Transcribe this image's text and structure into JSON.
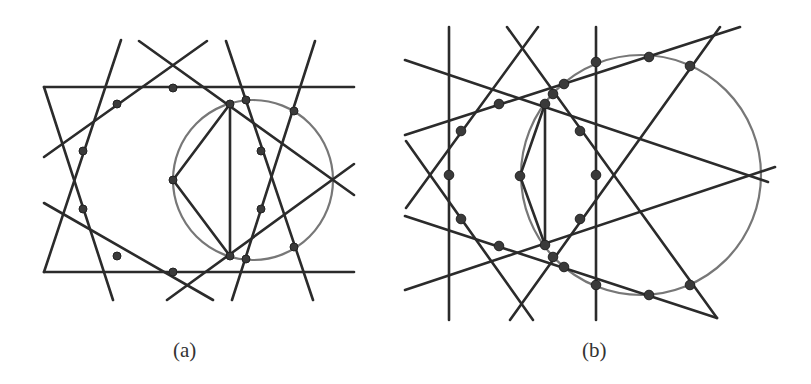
{
  "figure": {
    "panels": [
      {
        "id": "a",
        "caption": "(a)",
        "circle": {
          "cx": 253,
          "cy": 180,
          "r": 80,
          "stroke": "#777777"
        },
        "lines": [
          [
            44,
            87,
            354,
            87
          ],
          [
            44,
            272,
            354,
            272
          ],
          [
            44,
            87,
            113,
            300
          ],
          [
            44,
            272,
            121,
            40
          ],
          [
            44,
            157,
            207,
            41
          ],
          [
            44,
            203,
            213,
            300
          ],
          [
            139,
            41,
            354,
            195
          ],
          [
            167,
            300,
            354,
            164
          ],
          [
            226,
            41,
            313,
            300
          ],
          [
            315,
            41,
            232,
            300
          ],
          [
            230,
            104,
            173,
            180
          ],
          [
            173,
            180,
            230,
            256
          ],
          [
            230,
            104,
            230,
            256
          ]
        ],
        "points": [
          [
            173,
            88
          ],
          [
            117,
            104
          ],
          [
            83,
            151
          ],
          [
            83,
            209
          ],
          [
            117,
            256
          ],
          [
            173,
            272
          ],
          [
            230,
            104
          ],
          [
            246,
            100
          ],
          [
            294,
            111
          ],
          [
            261,
            151
          ],
          [
            173,
            180
          ],
          [
            261,
            209
          ],
          [
            230,
            256
          ],
          [
            246,
            259
          ],
          [
            294,
            247
          ]
        ]
      },
      {
        "id": "b",
        "caption": "(b)",
        "circle": {
          "cx": 641,
          "cy": 175,
          "r": 120,
          "stroke": "#777777"
        },
        "lines": [
          [
            449,
            27,
            449,
            320
          ],
          [
            596,
            27,
            596,
            320
          ],
          [
            405,
            60,
            768,
            182
          ],
          [
            405,
            135,
            740,
            27
          ],
          [
            405,
            290,
            775,
            167
          ],
          [
            405,
            216,
            717,
            318
          ],
          [
            406,
            141,
            533,
            320
          ],
          [
            406,
            208,
            538,
            27
          ],
          [
            507,
            27,
            717,
            318
          ],
          [
            510,
            320,
            720,
            27
          ],
          [
            545,
            104,
            520,
            176
          ],
          [
            520,
            176,
            545,
            245
          ],
          [
            545,
            104,
            545,
            245
          ]
        ],
        "points": [
          [
            461,
            131
          ],
          [
            499,
            104
          ],
          [
            461,
            219
          ],
          [
            499,
            246
          ],
          [
            449,
            175
          ],
          [
            520,
            176
          ],
          [
            596,
            175
          ],
          [
            545,
            104
          ],
          [
            553,
            94
          ],
          [
            564,
            84
          ],
          [
            596,
            62
          ],
          [
            649,
            57
          ],
          [
            690,
            66
          ],
          [
            580,
            131
          ],
          [
            580,
            219
          ],
          [
            545,
            245
          ],
          [
            553,
            257
          ],
          [
            564,
            267
          ],
          [
            596,
            285
          ],
          [
            649,
            295
          ],
          [
            690,
            285
          ]
        ]
      }
    ],
    "line_color": "#2b2b2b",
    "point_color": "#3a3a3a"
  }
}
